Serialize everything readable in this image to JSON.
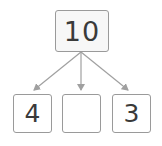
{
  "diagram": {
    "type": "number-bond",
    "whole": "10",
    "parts": [
      {
        "label": "4"
      },
      {
        "label": ""
      },
      {
        "label": "3"
      }
    ],
    "colors": {
      "border": "#9a9a9a",
      "arrow": "#a0a0a0",
      "text": "#3a3a3a",
      "box_fill": "#f7f7f7"
    }
  }
}
